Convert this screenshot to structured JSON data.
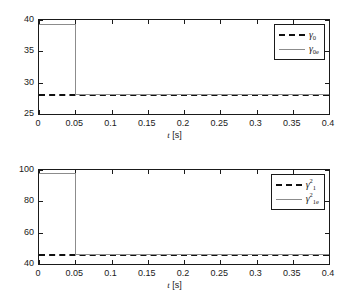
{
  "figure": {
    "background": "#ffffff",
    "axis_color": "#1a1a1a",
    "dashed_color": "#111111",
    "solid_color": "#8c8c8c"
  },
  "chart_data": [
    {
      "type": "line",
      "panel": "top",
      "title": "",
      "xlabel": "t [s]",
      "ylabel": "",
      "xlim": [
        0,
        0.4
      ],
      "ylim": [
        25,
        40
      ],
      "xticks": [
        0,
        0.05,
        0.1,
        0.15,
        0.2,
        0.25,
        0.3,
        0.35,
        0.4
      ],
      "xticklabels": [
        "0",
        "0.05",
        "0.1",
        "0.15",
        "0.2",
        "0.25",
        "0.3",
        "0.35",
        "0.4"
      ],
      "yticks": [
        25,
        30,
        35,
        40
      ],
      "yticklabels": [
        "25",
        "30",
        "35",
        "40"
      ],
      "grid": false,
      "legend_position": "upper right",
      "series": [
        {
          "name": "gamma_0",
          "label_base": "γ",
          "label_sub": "0",
          "label_sup": "",
          "style": "dashed",
          "color": "#111111",
          "x": [
            0,
            0.4
          ],
          "values": [
            28.2,
            28.2
          ],
          "description": "true value, constant 28.2"
        },
        {
          "name": "gamma_0e",
          "label_base": "γ",
          "label_sub": "0e",
          "label_sup": "",
          "style": "solid",
          "color": "#8c8c8c",
          "x": [
            0,
            0.05,
            0.05,
            0.4
          ],
          "values": [
            39.3,
            39.3,
            28.2,
            28.2
          ],
          "description": "estimate, steps from 39.3 to 28.2 at t = 0.05 s"
        }
      ]
    },
    {
      "type": "line",
      "panel": "bottom",
      "title": "",
      "xlabel": "t [s]",
      "ylabel": "",
      "xlim": [
        0,
        0.4
      ],
      "ylim": [
        40,
        100
      ],
      "xticks": [
        0,
        0.05,
        0.1,
        0.15,
        0.2,
        0.25,
        0.3,
        0.35,
        0.4
      ],
      "xticklabels": [
        "0",
        "0.05",
        "0.1",
        "0.15",
        "0.2",
        "0.25",
        "0.3",
        "0.35",
        "0.4"
      ],
      "yticks": [
        40,
        60,
        80,
        100
      ],
      "yticklabels": [
        "40",
        "60",
        "80",
        "100"
      ],
      "grid": false,
      "legend_position": "upper right",
      "series": [
        {
          "name": "gamma_1_squared",
          "label_base": "γ",
          "label_sub": "1",
          "label_sup": "2",
          "style": "dashed",
          "color": "#111111",
          "x": [
            0,
            0.4
          ],
          "values": [
            46.5,
            46.5
          ],
          "description": "true value, constant 46.5"
        },
        {
          "name": "gamma_1e_squared",
          "label_base": "γ",
          "label_sub": "1e",
          "label_sup": "2",
          "style": "solid",
          "color": "#8c8c8c",
          "x": [
            0,
            0.05,
            0.05,
            0.4
          ],
          "values": [
            98.0,
            98.0,
            46.5,
            46.5
          ],
          "description": "estimate, steps from 98 to 46.5 at t = 0.05 s"
        }
      ]
    }
  ]
}
